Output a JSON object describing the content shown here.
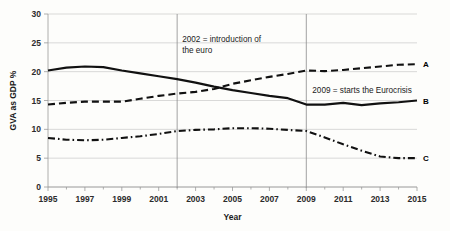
{
  "chart_data": {
    "type": "line",
    "title": "",
    "xlabel": "Year",
    "ylabel": "GVA as GDP %",
    "xlim": [
      1995,
      2015
    ],
    "ylim": [
      0,
      30
    ],
    "yticks": [
      0,
      5,
      10,
      15,
      20,
      25,
      30
    ],
    "xticks": [
      1995,
      1997,
      1999,
      2001,
      2003,
      2005,
      2007,
      2009,
      2011,
      2013,
      2015
    ],
    "grid": "horizontal",
    "legend": "series labels at right end of each line",
    "x": [
      1995,
      1996,
      1997,
      1998,
      1999,
      2000,
      2001,
      2002,
      2003,
      2004,
      2005,
      2006,
      2007,
      2008,
      2009,
      2010,
      2011,
      2012,
      2013,
      2014,
      2015
    ],
    "series": [
      {
        "name": "A",
        "label": "A",
        "style": "dashed",
        "label_value": 21.3,
        "values": [
          14.3,
          14.6,
          14.8,
          14.8,
          14.8,
          15.3,
          15.8,
          16.2,
          16.5,
          17.0,
          17.9,
          18.5,
          19.1,
          19.6,
          20.2,
          20.1,
          20.3,
          20.6,
          20.9,
          21.2,
          21.3
        ]
      },
      {
        "name": "B",
        "label": "B",
        "style": "solid",
        "label_value": 15.0,
        "values": [
          20.2,
          20.7,
          20.9,
          20.8,
          20.2,
          19.7,
          19.2,
          18.7,
          18.1,
          17.4,
          16.8,
          16.3,
          15.8,
          15.4,
          14.3,
          14.3,
          14.6,
          14.2,
          14.5,
          14.7,
          15.0
        ]
      },
      {
        "name": "C",
        "label": "C",
        "style": "dashdot",
        "label_value": 5.0,
        "values": [
          8.5,
          8.2,
          8.1,
          8.2,
          8.5,
          8.8,
          9.2,
          9.7,
          9.9,
          10.0,
          10.2,
          10.2,
          10.1,
          9.9,
          9.7,
          8.6,
          7.4,
          6.3,
          5.3,
          5.0,
          5.0
        ]
      }
    ],
    "reference_lines": [
      {
        "name": "euro-introduction",
        "x": 2002,
        "annotation": [
          "2002 = introduction of",
          "the euro"
        ]
      },
      {
        "name": "eurocrisis-start",
        "x": 2009,
        "annotation": [
          "2009 = starts the Eurocrisis"
        ]
      }
    ],
    "annotations": [
      {
        "name": "euro-introduction-annotation",
        "line1": "2002 = introduction of",
        "line2": "the euro"
      },
      {
        "name": "eurocrisis-annotation",
        "line1": "2009 = starts the Eurocrisis"
      }
    ],
    "colors": {
      "series": "#111111",
      "grid": "#c9c9c9",
      "axis": "#9a9a9a",
      "background": "#fdfdfb",
      "text": "#1a1a1a"
    }
  }
}
